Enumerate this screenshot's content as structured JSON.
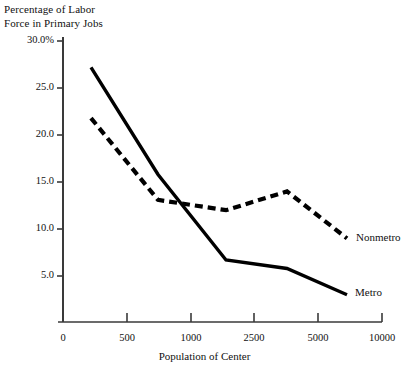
{
  "chart_data": {
    "type": "line",
    "title": "",
    "xlabel": "Population of Center",
    "ylabel": "Percentage of Labor\nForce in Primary Jobs",
    "x_tick_labels": [
      "0",
      "500",
      "1000",
      "2500",
      "5000",
      "10000"
    ],
    "y_tick_labels": [
      "30.0%",
      "25.0",
      "20.0",
      "15.0",
      "10.0",
      "5.0"
    ],
    "y_tick_values": [
      30.0,
      25.0,
      20.0,
      15.0,
      10.0,
      5.0
    ],
    "ylim": [
      0,
      30
    ],
    "x_scale": "ordinal",
    "grid": false,
    "legend_position": "right-inline",
    "series": [
      {
        "name": "Metro",
        "style": "solid",
        "color": "#000000",
        "points": [
          {
            "x": 250,
            "y": 27.2
          },
          {
            "x": 700,
            "y": 15.8
          },
          {
            "x": 1250,
            "y": 6.7
          },
          {
            "x": 2750,
            "y": 5.8
          },
          {
            "x": 7500,
            "y": 3.0
          }
        ]
      },
      {
        "name": "Nonmetro",
        "style": "dashed",
        "color": "#000000",
        "points": [
          {
            "x": 250,
            "y": 21.8
          },
          {
            "x": 700,
            "y": 13.1
          },
          {
            "x": 1250,
            "y": 12.0
          },
          {
            "x": 2750,
            "y": 14.0
          },
          {
            "x": 7500,
            "y": 9.0
          }
        ]
      }
    ],
    "annotations": [
      {
        "text": "Nonmetro",
        "x_px": 356,
        "y_px": 238
      },
      {
        "text": "Metro",
        "x_px": 355,
        "y_px": 293
      }
    ]
  },
  "axis": {
    "line_color": "#3a3a3a",
    "origin_px": {
      "x": 63,
      "y": 322
    },
    "x_tick_px": [
      63,
      127,
      191,
      254,
      318,
      382
    ],
    "y_tick_px": [
      41,
      88,
      135,
      182,
      229,
      276
    ]
  }
}
